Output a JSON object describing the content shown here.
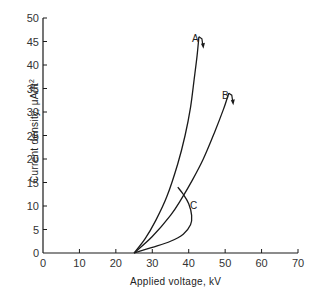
{
  "chart_data": {
    "type": "line",
    "title": "",
    "xlabel": "Applied voltage, kV",
    "ylabel": "Current density, μA/ft²",
    "xlim": [
      0,
      70
    ],
    "ylim": [
      0,
      50
    ],
    "xticks": [
      0,
      10,
      20,
      30,
      40,
      50,
      60,
      70
    ],
    "yticks": [
      0,
      5,
      10,
      15,
      20,
      25,
      30,
      35,
      40,
      45,
      50
    ],
    "grid": false,
    "legend": "none (curves labeled inline)",
    "series": [
      {
        "name": "A",
        "points": [
          [
            25,
            0
          ],
          [
            28,
            3
          ],
          [
            31,
            7
          ],
          [
            34,
            12
          ],
          [
            37,
            19
          ],
          [
            39,
            25
          ],
          [
            40.5,
            31
          ],
          [
            41.5,
            37
          ],
          [
            42.3,
            42
          ],
          [
            42.8,
            46
          ]
        ],
        "annotation": "arrow pointing down at top (breakdown)"
      },
      {
        "name": "B",
        "points": [
          [
            25,
            0
          ],
          [
            30,
            3.5
          ],
          [
            35,
            8
          ],
          [
            38,
            11.5
          ],
          [
            41,
            15.5
          ],
          [
            44,
            20
          ],
          [
            47,
            25.5
          ],
          [
            49.5,
            30.5
          ],
          [
            51,
            34
          ]
        ],
        "annotation": "arrow pointing down at top (breakdown)"
      },
      {
        "name": "C",
        "points": [
          [
            25,
            0
          ],
          [
            30,
            1.2
          ],
          [
            35,
            2.5
          ],
          [
            38.5,
            4
          ],
          [
            40.5,
            6
          ],
          [
            40.8,
            8
          ],
          [
            40,
            10.5
          ],
          [
            38.5,
            12.5
          ],
          [
            37,
            14
          ]
        ],
        "annotation": "curve bends back (negative resistance region)"
      }
    ]
  },
  "labels": {
    "xlabel": "Applied voltage,   kV",
    "ylabel": "Current density,  μA/ft",
    "ylabel_sup": "2",
    "curve_a": "A",
    "curve_b": "B",
    "curve_c": "C",
    "xticks": [
      "0",
      "10",
      "20",
      "30",
      "40",
      "50",
      "60",
      "70"
    ],
    "yticks": [
      "0",
      "5",
      "10",
      "15",
      "20",
      "25",
      "30",
      "35",
      "40",
      "45",
      "50"
    ]
  },
  "colors": {
    "line": "#1a1a1a",
    "background": "#ffffff"
  }
}
